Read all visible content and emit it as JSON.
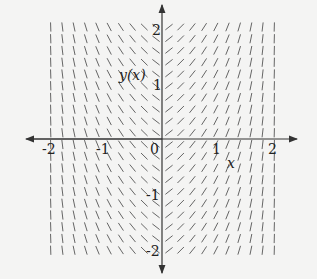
{
  "figure": {
    "type": "slope-field",
    "x_axis_label": "x",
    "y_axis_label": "y(x)",
    "x_ticks": [
      "-2",
      "-1",
      "0",
      "1",
      "2"
    ],
    "y_ticks": [
      "2",
      "1",
      "-1",
      "-2"
    ],
    "x_range": [
      -2,
      2
    ],
    "y_range": [
      -2,
      2
    ],
    "grid": {
      "columns_left": 10,
      "columns_right": 10,
      "rows": 20
    },
    "slope_description": "Slopes depend only on x: negative for x<0, positive for x>0, steepening to nearly vertical as |x| approaches 2",
    "colors": {
      "axis": "#333333",
      "segment": "#555555",
      "background": "#f4f4f3"
    }
  }
}
